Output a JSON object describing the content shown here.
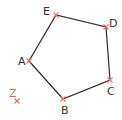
{
  "diagram": {
    "type": "pentagon",
    "colors": {
      "edge": "#2b2b2b",
      "marker": "#e07060",
      "label": "#333333"
    },
    "points": [
      {
        "id": "A",
        "label": "A",
        "x": 29,
        "y": 61,
        "lx": 18,
        "ly": 65
      },
      {
        "id": "B",
        "label": "B",
        "x": 63,
        "y": 99,
        "lx": 61,
        "ly": 114
      },
      {
        "id": "C",
        "label": "C",
        "x": 110,
        "y": 80,
        "lx": 107,
        "ly": 95
      },
      {
        "id": "D",
        "label": "D",
        "x": 106,
        "y": 27,
        "lx": 109,
        "ly": 27
      },
      {
        "id": "E",
        "label": "E",
        "x": 56,
        "y": 15,
        "lx": 43,
        "ly": 15
      }
    ],
    "edges": [
      [
        "A",
        "B"
      ],
      [
        "B",
        "C"
      ],
      [
        "C",
        "D"
      ],
      [
        "D",
        "E"
      ],
      [
        "E",
        "A"
      ]
    ],
    "extra_point": {
      "id": "Z",
      "label": "Z",
      "x": 17,
      "y": 101,
      "lx": 9,
      "ly": 97
    }
  }
}
